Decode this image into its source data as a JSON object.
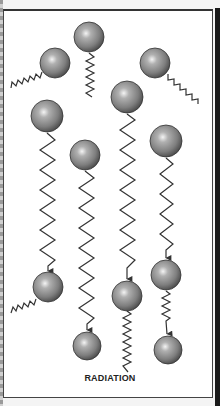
{
  "diagram": {
    "label": "RADIATION",
    "colors": {
      "background": "#ffffff",
      "ball_light": "#f2f2f2",
      "ball_mid": "#8a8a8a",
      "ball_dark": "#4a4a4a",
      "wave": "#333333",
      "border": "#444444"
    },
    "particles": [
      {
        "id": "top-left",
        "x": 55,
        "y": 63,
        "r": 15
      },
      {
        "id": "top-center",
        "x": 89,
        "y": 37,
        "r": 15
      },
      {
        "id": "top-right",
        "x": 155,
        "y": 63,
        "r": 15
      },
      {
        "id": "col1-upper",
        "x": 47,
        "y": 116,
        "r": 16
      },
      {
        "id": "col2-upper",
        "x": 85,
        "y": 155,
        "r": 15
      },
      {
        "id": "col3-upper",
        "x": 127,
        "y": 97,
        "r": 16
      },
      {
        "id": "col4-upper",
        "x": 166,
        "y": 141,
        "r": 16
      },
      {
        "id": "col1-lower",
        "x": 48,
        "y": 287,
        "r": 15
      },
      {
        "id": "col2-lower",
        "x": 87,
        "y": 346,
        "r": 14
      },
      {
        "id": "col3-lower",
        "x": 127,
        "y": 296,
        "r": 15
      },
      {
        "id": "col4-mid",
        "x": 166,
        "y": 275,
        "r": 15
      },
      {
        "id": "col4-lower",
        "x": 168,
        "y": 350,
        "r": 14
      }
    ]
  }
}
